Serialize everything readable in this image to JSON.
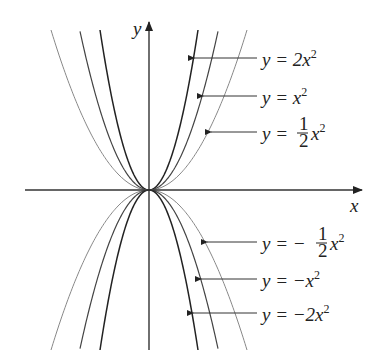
{
  "chart_data": {
    "type": "line",
    "title": "",
    "xlabel": "x",
    "ylabel": "y",
    "grid": false,
    "legend_position": "right (arrow-annotated labels)",
    "series": [
      {
        "name": "y = 2x^2",
        "a": 2,
        "color": "#222222"
      },
      {
        "name": "y = x^2",
        "a": 1,
        "color": "#444444"
      },
      {
        "name": "y = 1/2 x^2",
        "a": 0.5,
        "color": "#888888"
      },
      {
        "name": "y = -1/2 x^2",
        "a": -0.5,
        "color": "#888888"
      },
      {
        "name": "y = -x^2",
        "a": -1,
        "color": "#444444"
      },
      {
        "name": "y = -2x^2",
        "a": -2,
        "color": "#222222"
      }
    ]
  },
  "axes": {
    "x_label": "x",
    "y_label": "y"
  },
  "labels": {
    "l1": {
      "pre": "y = 2x",
      "sup": "2"
    },
    "l2": {
      "pre": "y = x",
      "sup": "2"
    },
    "l3": {
      "pre": "y = ",
      "num": "1",
      "den": "2",
      "post": "x",
      "sup": "2"
    },
    "l4": {
      "pre": "y = − ",
      "num": "1",
      "den": "2",
      "post": "x",
      "sup": "2"
    },
    "l5": {
      "pre": "y = −x",
      "sup": "2"
    },
    "l6": {
      "pre": "y = −2x",
      "sup": "2"
    }
  }
}
